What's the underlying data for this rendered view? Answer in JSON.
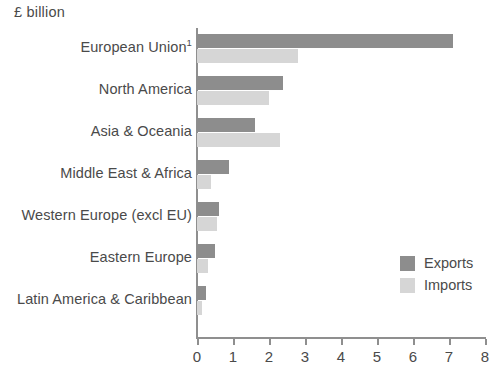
{
  "chart_data": {
    "type": "bar",
    "orientation": "horizontal",
    "title": "£ billion",
    "xlabel": "",
    "ylabel": "",
    "xlim": [
      0,
      8
    ],
    "xticks": [
      "0",
      "1",
      "2",
      "3",
      "4",
      "5",
      "6",
      "7",
      "8"
    ],
    "grid": false,
    "legend_position": "bottom-right",
    "categories": [
      "European Union",
      "North America",
      "Asia & Oceania",
      "Middle East & Africa",
      "Western Europe (excl EU)",
      "Eastern Europe",
      "Latin America & Caribbean"
    ],
    "category_footnotes": [
      "1",
      "",
      "",
      "",
      "",
      "",
      ""
    ],
    "series": [
      {
        "name": "Exports",
        "color": "#8d8d8d",
        "values": [
          7.1,
          2.4,
          1.6,
          0.9,
          0.6,
          0.5,
          0.25
        ]
      },
      {
        "name": "Imports",
        "color": "#d6d6d6",
        "values": [
          2.8,
          2.0,
          2.3,
          0.4,
          0.55,
          0.3,
          0.15
        ]
      }
    ]
  },
  "legend": {
    "items": [
      {
        "label": "Exports",
        "color": "#8d8d8d"
      },
      {
        "label": "Imports",
        "color": "#d6d6d6"
      }
    ]
  },
  "colors": {
    "exports": "#8d8d8d",
    "imports": "#d6d6d6",
    "axis": "#8f8f8f",
    "text": "#4a4a4a",
    "background": "#ffffff"
  }
}
